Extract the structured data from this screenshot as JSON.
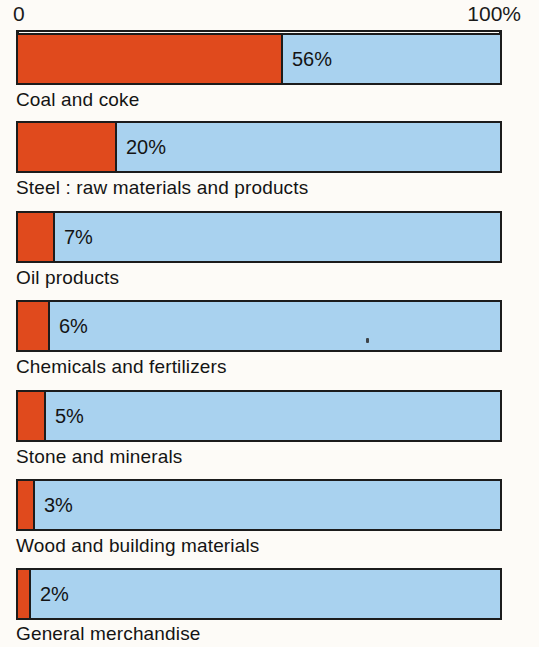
{
  "title": {
    "text": "",
    "clipped": true,
    "note": "title row is cropped off the top edge; glyphs not legible"
  },
  "axis": {
    "min_label": "0",
    "max_label": "100%"
  },
  "colors": {
    "share": "#e04a1d",
    "remainder": "#a9d2ef",
    "outline": "#1c1c1c",
    "background": "#fdfbf7",
    "text": "#141414"
  },
  "bars": [
    {
      "label": "Coal and coke",
      "value_label": "56%",
      "value": 56,
      "drawn_fraction": 0.546,
      "top": 33
    },
    {
      "label": "Steel : raw materials and products",
      "value_label": "20%",
      "value": 20,
      "drawn_fraction": 0.204,
      "top": 121
    },
    {
      "label": "Oil products",
      "value_label": "7%",
      "value": 7,
      "drawn_fraction": 0.076,
      "top": 211
    },
    {
      "label": "Chemicals and fertilizers",
      "value_label": "6%",
      "value": 6,
      "drawn_fraction": 0.066,
      "top": 300
    },
    {
      "label": "Stone and minerals",
      "value_label": "5%",
      "value": 5,
      "drawn_fraction": 0.058,
      "top": 390
    },
    {
      "label": "Wood and building materials",
      "value_label": "3%",
      "value": 3,
      "drawn_fraction": 0.035,
      "top": 479
    },
    {
      "label": "General merchandise",
      "value_label": "2%",
      "value": 2,
      "drawn_fraction": 0.027,
      "top": 568
    }
  ],
  "chart_data": {
    "type": "bar",
    "orientation": "horizontal",
    "subtype": "100% stacked (share vs remainder)",
    "title": "",
    "xlabel": "",
    "ylabel": "",
    "xlim": [
      0,
      100
    ],
    "xtick_labels": [
      "0",
      "100%"
    ],
    "grid": false,
    "legend": "none",
    "categories": [
      "Coal and coke",
      "Steel : raw materials and products",
      "Oil products",
      "Chemicals and fertilizers",
      "Stone and minerals",
      "Wood and building materials",
      "General merchandise"
    ],
    "values": [
      56,
      20,
      7,
      6,
      5,
      3,
      2
    ],
    "value_labels": [
      "56%",
      "20%",
      "7%",
      "6%",
      "5%",
      "3%",
      "2%"
    ],
    "series": [
      {
        "name": "share",
        "color": "#e04a1d",
        "values": [
          56,
          20,
          7,
          6,
          5,
          3,
          2
        ]
      },
      {
        "name": "remainder",
        "color": "#a9d2ef",
        "values": [
          44,
          80,
          93,
          94,
          95,
          97,
          98
        ]
      }
    ],
    "units": "percent"
  }
}
